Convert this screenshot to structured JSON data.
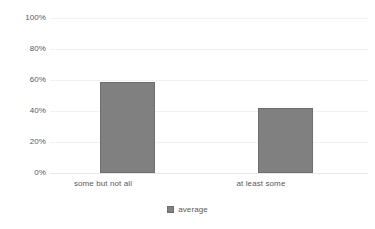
{
  "chart_data": {
    "type": "bar",
    "title": "",
    "subtitle": "",
    "xlabel": "",
    "ylabel": "",
    "categories": [
      "some but not all",
      "at least some"
    ],
    "series": [
      {
        "name": "average",
        "values": [
          59,
          42
        ],
        "color": "#808080"
      }
    ],
    "values": [
      59,
      42
    ],
    "ylim": [
      0,
      100
    ],
    "ytick_labels": [
      "100%",
      "80%",
      "60%",
      "40%",
      "20%",
      "0%"
    ],
    "ytick_values": [
      100,
      80,
      60,
      40,
      20,
      0
    ],
    "grid": true,
    "legend_position": "bottom",
    "value_suffix": "%"
  },
  "axis": {
    "ticks": [
      {
        "label": "100%",
        "value": 100
      },
      {
        "label": "80%",
        "value": 80
      },
      {
        "label": "60%",
        "value": 60
      },
      {
        "label": "40%",
        "value": 40
      },
      {
        "label": "20%",
        "value": 20
      },
      {
        "label": "0%",
        "value": 0
      }
    ]
  },
  "bars": [
    {
      "category": "some but not all",
      "value": 59
    },
    {
      "category": "at least some",
      "value": 42
    }
  ],
  "legend": {
    "items": [
      {
        "label": "average",
        "color": "#808080",
        "marker": "square-swatch"
      }
    ]
  },
  "colors": {
    "bar_fill": "#808080",
    "bar_stroke": "#6e6e6e",
    "gridline": "#f2f2f2",
    "baseline": "#e8e8e8",
    "text": "#5a5a5a",
    "background": "#ffffff"
  }
}
